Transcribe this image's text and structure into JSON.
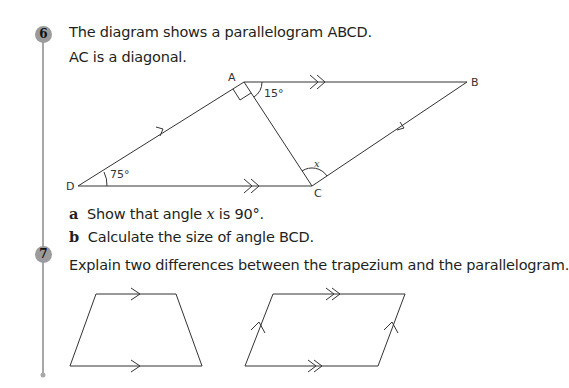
{
  "questions": [
    {
      "number": "6",
      "lines": [
        "The diagram shows a parallelogram ABCD.",
        "AC is a diagonal."
      ],
      "diagram": {
        "vertices": {
          "A": "A",
          "B": "B",
          "C": "C",
          "D": "D"
        },
        "angles": {
          "at_A": "15°",
          "at_D": "75°",
          "at_C": "x"
        }
      },
      "parts": [
        {
          "label": "a",
          "text_pre": "Show that angle ",
          "var": "x",
          "text_post": " is 90°."
        },
        {
          "label": "b",
          "text": "Calculate the size of angle BCD."
        }
      ]
    },
    {
      "number": "7",
      "lines": [
        "Explain two differences between the trapezium and the parallelogram."
      ]
    }
  ],
  "colors": {
    "badge": "#9b9b9b",
    "rule": "#a0a0a0",
    "ink": "#231f20"
  }
}
